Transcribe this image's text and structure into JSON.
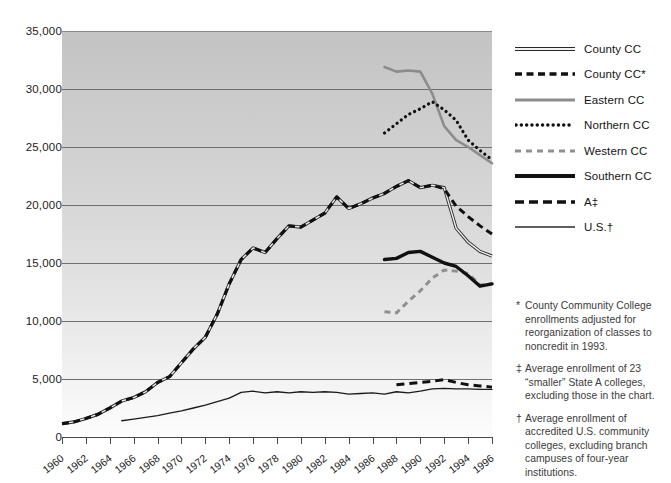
{
  "chart_data": {
    "type": "line",
    "title": "",
    "xlabel": "",
    "ylabel": "",
    "xlim": [
      1960,
      1996
    ],
    "ylim": [
      0,
      35000
    ],
    "ytick_step": 5000,
    "grid": "horizontal",
    "legend_position": "right",
    "background": "gray vertical gradient, light at bottom",
    "ytick_labels": [
      "35,000",
      "30,000",
      "25,000",
      "20,000",
      "15,000",
      "10,000",
      "5,000",
      "0"
    ],
    "ytick_values": [
      35000,
      30000,
      25000,
      20000,
      15000,
      10000,
      5000,
      0
    ],
    "xtick_labels": [
      "1960",
      "1962",
      "1964",
      "1966",
      "1968",
      "1970",
      "1972",
      "1974",
      "1976",
      "1978",
      "1980",
      "1982",
      "1984",
      "1986",
      "1988",
      "1990",
      "1992",
      "1994",
      "1996"
    ],
    "xtick_values": [
      1960,
      1962,
      1964,
      1966,
      1968,
      1970,
      1972,
      1974,
      1976,
      1978,
      1980,
      1982,
      1984,
      1986,
      1988,
      1990,
      1992,
      1994,
      1996
    ],
    "series": [
      {
        "name": "County CC",
        "style": "double-hollow-line",
        "color": "#1b1b1b",
        "x": [
          1960,
          1961,
          1962,
          1963,
          1964,
          1965,
          1966,
          1967,
          1968,
          1969,
          1970,
          1971,
          1972,
          1973,
          1974,
          1975,
          1976,
          1977,
          1978,
          1979,
          1980,
          1981,
          1982,
          1983,
          1984,
          1985,
          1986,
          1987,
          1988,
          1989,
          1990,
          1991,
          1992,
          1993,
          1994,
          1995,
          1996
        ],
        "values": [
          1150,
          1300,
          1600,
          1950,
          2500,
          3100,
          3400,
          3900,
          4700,
          5200,
          6400,
          7600,
          8600,
          10600,
          13200,
          15300,
          16300,
          15900,
          17100,
          18200,
          18100,
          18700,
          19300,
          20700,
          19700,
          20100,
          20600,
          21000,
          21600,
          22100,
          21500,
          21700,
          21500,
          18000,
          16800,
          16000,
          15600
        ]
      },
      {
        "name": "County CC*",
        "style": "dashed-heavy",
        "color": "#111111",
        "x": [
          1960,
          1961,
          1962,
          1963,
          1964,
          1965,
          1966,
          1967,
          1968,
          1969,
          1970,
          1971,
          1972,
          1973,
          1974,
          1975,
          1976,
          1977,
          1978,
          1979,
          1980,
          1981,
          1982,
          1983,
          1984,
          1985,
          1986,
          1987,
          1988,
          1989,
          1990,
          1991,
          1992,
          1993,
          1994,
          1995,
          1996
        ],
        "values": [
          1150,
          1300,
          1600,
          1950,
          2500,
          3100,
          3400,
          3900,
          4700,
          5200,
          6400,
          7600,
          8600,
          10600,
          13200,
          15300,
          16300,
          15900,
          17100,
          18200,
          18100,
          18700,
          19300,
          20700,
          19700,
          20100,
          20600,
          21000,
          21600,
          22100,
          21500,
          21700,
          21400,
          19900,
          19000,
          18200,
          17500
        ]
      },
      {
        "name": "Eastern CC",
        "style": "solid-gray",
        "color": "#8c8c8c",
        "x": [
          1987,
          1988,
          1989,
          1990,
          1991,
          1992,
          1993,
          1994,
          1995,
          1996
        ],
        "values": [
          31900,
          31500,
          31600,
          31500,
          29600,
          26800,
          25600,
          25000,
          24300,
          23600
        ]
      },
      {
        "name": "Northern CC",
        "style": "dotted",
        "color": "#111111",
        "x": [
          1987,
          1988,
          1989,
          1990,
          1991,
          1992,
          1993,
          1994,
          1995,
          1996
        ],
        "values": [
          26200,
          27000,
          27800,
          28300,
          28900,
          28200,
          27300,
          25600,
          24700,
          23900
        ]
      },
      {
        "name": "Western CC",
        "style": "dashed-gray",
        "color": "#909090",
        "x": [
          1987,
          1988,
          1989,
          1990,
          1991,
          1992,
          1993,
          1994,
          1995,
          1996
        ],
        "values": [
          10800,
          10700,
          11700,
          12600,
          13700,
          14400,
          14300,
          14100,
          13100,
          13200
        ]
      },
      {
        "name": "Southern CC",
        "style": "thick-solid-black",
        "color": "#111111",
        "x": [
          1987,
          1988,
          1989,
          1990,
          1991,
          1992,
          1993,
          1994,
          1995,
          1996
        ],
        "values": [
          15300,
          15400,
          15900,
          16000,
          15500,
          15000,
          14700,
          13900,
          13000,
          13200
        ]
      },
      {
        "name": "A‡",
        "style": "dashed-long",
        "color": "#111111",
        "x": [
          1988,
          1989,
          1990,
          1991,
          1992,
          1993,
          1994,
          1995,
          1996
        ],
        "values": [
          4500,
          4600,
          4700,
          4800,
          4950,
          4700,
          4500,
          4400,
          4300
        ]
      },
      {
        "name": "U.S.†",
        "style": "thin-solid-black",
        "color": "#1b1b1b",
        "x": [
          1965,
          1966,
          1967,
          1968,
          1969,
          1970,
          1971,
          1972,
          1973,
          1974,
          1975,
          1976,
          1977,
          1978,
          1979,
          1980,
          1981,
          1982,
          1983,
          1984,
          1985,
          1986,
          1987,
          1988,
          1989,
          1990,
          1991,
          1992,
          1993,
          1994,
          1995,
          1996
        ],
        "values": [
          1400,
          1550,
          1700,
          1850,
          2050,
          2250,
          2500,
          2750,
          3050,
          3350,
          3850,
          3950,
          3800,
          3900,
          3800,
          3900,
          3850,
          3900,
          3850,
          3700,
          3750,
          3800,
          3700,
          3900,
          3800,
          3950,
          4150,
          4200,
          4150,
          4150,
          4100,
          4100
        ]
      }
    ]
  },
  "legend": {
    "items": [
      {
        "label": "County CC",
        "swatch": "double-hollow-line-swatch"
      },
      {
        "label": "County CC*",
        "swatch": "dashed-heavy-swatch"
      },
      {
        "label": "Eastern CC",
        "swatch": "solid-gray-swatch"
      },
      {
        "label": "Northern CC",
        "swatch": "dotted-swatch"
      },
      {
        "label": "Western CC",
        "swatch": "dashed-gray-swatch"
      },
      {
        "label": "Southern CC",
        "swatch": "thick-solid-black-swatch"
      },
      {
        "label": "A‡",
        "swatch": "dashed-long-swatch"
      },
      {
        "label": "U.S.†",
        "swatch": "thin-solid-black-swatch"
      }
    ]
  },
  "footnotes": [
    {
      "mark": "*",
      "text": "County Community College enrollments adjusted for reorganization of classes to noncredit in 1993."
    },
    {
      "mark": "‡",
      "text": "Average enrollment of 23 “smaller” State A colleges, excluding those in the chart."
    },
    {
      "mark": "†",
      "text": "Average enrollment of accredited U.S. community colleges, excluding branch campuses of four-year institutions."
    }
  ]
}
